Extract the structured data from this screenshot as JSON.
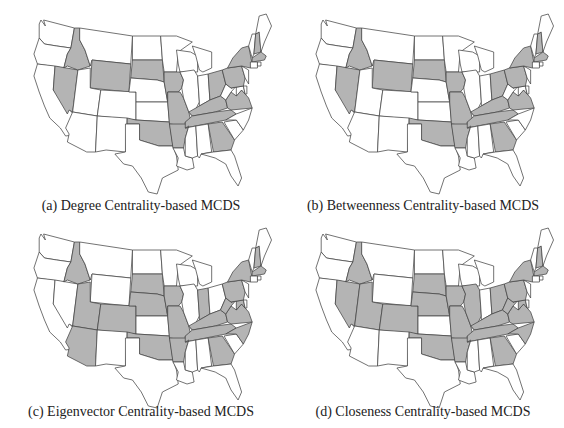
{
  "figure": {
    "shade_color": "#b4b4b4",
    "base_color": "#ffffff",
    "border_color": "#444444",
    "panels": [
      {
        "id": "a",
        "caption": "(a) Degree Centrality-based MCDS",
        "shaded_states": [
          "ID",
          "NV",
          "WY",
          "SD",
          "IA",
          "MO",
          "OK",
          "AR",
          "KY",
          "TN",
          "GA",
          "OH",
          "PA",
          "NY",
          "VA",
          "NH",
          "MA"
        ]
      },
      {
        "id": "b",
        "caption": "(b) Betweenness Centrality-based MCDS",
        "shaded_states": [
          "ID",
          "NV",
          "WY",
          "SD",
          "IA",
          "MO",
          "OK",
          "AR",
          "KY",
          "TN",
          "GA",
          "OH",
          "PA",
          "NY",
          "VA",
          "NH",
          "MA"
        ]
      },
      {
        "id": "c",
        "caption": "(c) Eigenvector Centrality-based MCDS",
        "shaded_states": [
          "ID",
          "UT",
          "AZ",
          "CO",
          "SD",
          "NE",
          "IA",
          "MO",
          "OK",
          "AR",
          "IN",
          "KY",
          "TN",
          "GA",
          "WV",
          "VA",
          "NC",
          "MD",
          "PA",
          "NY",
          "NH",
          "MA"
        ]
      },
      {
        "id": "d",
        "caption": "(d) Closeness Centrality-based MCDS",
        "shaded_states": [
          "ID",
          "NV",
          "UT",
          "CO",
          "SD",
          "NE",
          "IA",
          "IL",
          "MO",
          "OK",
          "AR",
          "KY",
          "TN",
          "GA",
          "OH",
          "WV",
          "VA",
          "NC",
          "MD",
          "PA",
          "NY",
          "NH",
          "MA"
        ]
      }
    ]
  }
}
